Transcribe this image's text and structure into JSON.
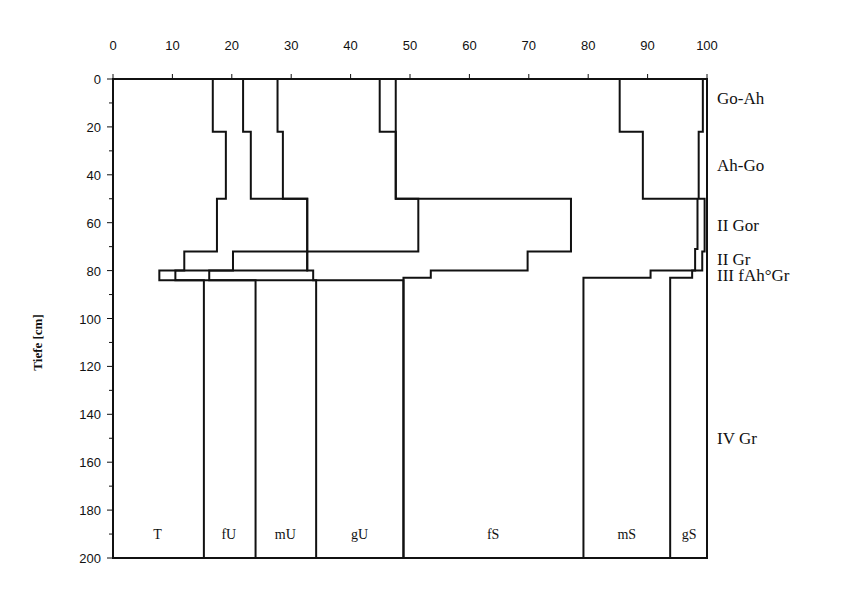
{
  "chart_data": {
    "type": "line",
    "subtype": "cumulative-stepped-depth-profile",
    "title": "",
    "xlabel": "",
    "ylabel": "Tiefe [cm]",
    "xlim": [
      0,
      100
    ],
    "ylim": [
      0,
      200
    ],
    "y_inverted": true,
    "x_axis_position": "top",
    "x_ticks": [
      0,
      10,
      20,
      30,
      40,
      50,
      60,
      70,
      80,
      90,
      100
    ],
    "y_ticks": [
      0,
      20,
      40,
      60,
      80,
      100,
      120,
      140,
      160,
      180,
      200
    ],
    "y_minor_ticks": [
      10,
      30,
      50,
      70,
      90,
      110,
      130,
      150,
      170,
      190
    ],
    "grid": false,
    "fraction_labels": [
      {
        "label": "T",
        "x": 7.5
      },
      {
        "label": "fU",
        "x": 19.5
      },
      {
        "label": "mU",
        "x": 29
      },
      {
        "label": "gU",
        "x": 41.5
      },
      {
        "label": "fS",
        "x": 64
      },
      {
        "label": "mS",
        "x": 86.5
      },
      {
        "label": "gS",
        "x": 97
      }
    ],
    "fraction_label_depth": 190,
    "horizons": [
      {
        "label": "Go-Ah",
        "depth": 8
      },
      {
        "label": "Ah-Go",
        "depth": 36
      },
      {
        "label": "II Gor",
        "depth": 61
      },
      {
        "label": "II Gr",
        "depth": 75
      },
      {
        "label": "III fAh°Gr",
        "depth": 82
      },
      {
        "label": "IV Gr",
        "depth": 150
      }
    ],
    "series": [
      {
        "name": "T",
        "steps": [
          [
            0,
            22,
            16.8
          ],
          [
            22,
            50,
            19.0
          ],
          [
            50,
            72,
            17.5
          ],
          [
            72,
            80,
            12.0
          ],
          [
            80,
            84,
            7.8
          ],
          [
            84,
            200,
            15.3
          ]
        ]
      },
      {
        "name": "fU",
        "steps": [
          [
            0,
            22,
            21.9
          ],
          [
            22,
            50,
            23.2
          ],
          [
            50,
            72,
            32.7
          ],
          [
            72,
            80,
            20.2
          ],
          [
            80,
            84,
            10.5
          ],
          [
            84,
            200,
            24.0
          ]
        ]
      },
      {
        "name": "mU",
        "steps": [
          [
            0,
            22,
            27.7
          ],
          [
            22,
            50,
            28.6
          ],
          [
            50,
            72,
            32.7
          ],
          [
            72,
            80,
            32.7
          ],
          [
            80,
            84,
            16.2
          ],
          [
            84,
            200,
            34.2
          ]
        ]
      },
      {
        "name": "gU",
        "steps": [
          [
            0,
            22,
            44.9
          ],
          [
            22,
            50,
            47.6
          ],
          [
            50,
            72,
            51.4
          ],
          [
            72,
            80,
            32.7
          ],
          [
            80,
            84,
            33.7
          ],
          [
            84,
            200,
            48.9
          ]
        ]
      },
      {
        "name": "fS",
        "steps": [
          [
            0,
            50,
            47.6
          ],
          [
            50,
            72,
            77.1
          ],
          [
            72,
            80,
            69.8
          ],
          [
            80,
            83,
            53.5
          ],
          [
            83,
            200,
            48.9
          ]
        ]
      },
      {
        "name": "mS",
        "steps": [
          [
            0,
            22,
            85.3
          ],
          [
            22,
            50,
            89.2
          ],
          [
            50,
            71,
            98.4
          ],
          [
            71,
            80,
            98.0
          ],
          [
            80,
            83,
            90.5
          ],
          [
            83,
            200,
            79.2
          ]
        ]
      },
      {
        "name": "gS",
        "steps": [
          [
            0,
            22,
            99.3
          ],
          [
            22,
            50,
            98.6
          ],
          [
            50,
            72,
            99.6
          ],
          [
            72,
            80,
            99.2
          ],
          [
            80,
            83,
            97.5
          ],
          [
            83,
            200,
            93.8
          ]
        ]
      },
      {
        "name": "total",
        "steps": [
          [
            0,
            200,
            100
          ]
        ]
      }
    ]
  }
}
